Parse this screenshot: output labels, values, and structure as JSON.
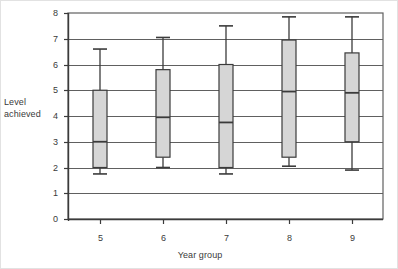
{
  "chart_data": {
    "type": "box",
    "title": "",
    "xlabel": "Year group",
    "ylabel": "Level achieved",
    "ylabel_lines": [
      "Level",
      "achieved"
    ],
    "categories": [
      "5",
      "6",
      "7",
      "8",
      "9"
    ],
    "yticks": [
      "0",
      "1",
      "2",
      "3",
      "4",
      "5",
      "6",
      "7",
      "8"
    ],
    "ylim": [
      0,
      8
    ],
    "grid": "horizontal",
    "legend": "none",
    "boxes": [
      {
        "category": "5",
        "whisker_low": 1.75,
        "q1": 2.0,
        "median": 3.0,
        "q3": 5.0,
        "whisker_high": 6.6
      },
      {
        "category": "6",
        "whisker_low": 2.0,
        "q1": 2.4,
        "median": 3.95,
        "q3": 5.8,
        "whisker_high": 7.05
      },
      {
        "category": "7",
        "whisker_low": 1.75,
        "q1": 2.0,
        "median": 3.75,
        "q3": 6.0,
        "whisker_high": 7.5
      },
      {
        "category": "8",
        "whisker_low": 2.05,
        "q1": 2.4,
        "median": 4.95,
        "q3": 6.95,
        "whisker_high": 7.85
      },
      {
        "category": "9",
        "whisker_low": 1.9,
        "q1": 3.0,
        "median": 4.9,
        "q3": 6.45,
        "whisker_high": 7.85
      }
    ],
    "colors": {
      "box_fill": "#d6d6d6",
      "box_stroke": "#3b3b3b",
      "grid": "#606060",
      "axis": "#3b3b3b",
      "background": "#ffffff",
      "text": "#3a3a3a"
    }
  }
}
